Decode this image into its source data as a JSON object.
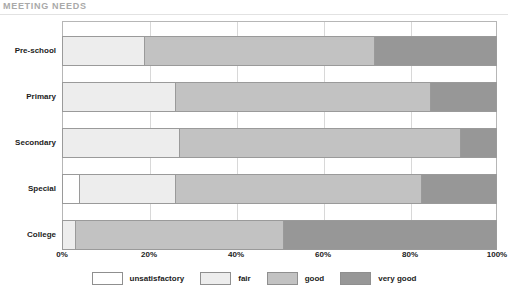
{
  "chart_data": {
    "type": "bar",
    "orientation": "horizontal",
    "stacked": true,
    "stack_mode": "percent",
    "title": "MEETING NEEDS",
    "xlabel": "",
    "ylabel": "",
    "xlim": [
      0,
      100
    ],
    "xticks": [
      0,
      20,
      40,
      60,
      80,
      100
    ],
    "xticklabels": [
      "0%",
      "20%",
      "40%",
      "60%",
      "80%",
      "100%"
    ],
    "grid": true,
    "legend_position": "bottom",
    "categories": [
      "Pre-school",
      "Primary",
      "Secondary",
      "Special",
      "College"
    ],
    "series": [
      {
        "name": "unsatisfactory",
        "color": "#ffffff",
        "values": [
          0,
          0,
          0,
          4,
          0
        ]
      },
      {
        "name": "fair",
        "color": "#ededed",
        "values": [
          19,
          26,
          27,
          22,
          3
        ]
      },
      {
        "name": "good",
        "color": "#c2c2c2",
        "values": [
          53,
          59,
          65,
          57,
          48
        ]
      },
      {
        "name": "very good",
        "color": "#979797",
        "values": [
          28,
          15,
          8,
          17,
          49
        ]
      }
    ]
  },
  "title": "MEETING NEEDS",
  "axis": {
    "ticks": [
      {
        "label": "0%",
        "value": 0
      },
      {
        "label": "20%",
        "value": 20
      },
      {
        "label": "40%",
        "value": 40
      },
      {
        "label": "60%",
        "value": 60
      },
      {
        "label": "80%",
        "value": 80
      },
      {
        "label": "100%",
        "value": 100
      }
    ]
  },
  "categories": [
    {
      "label": "Pre-school"
    },
    {
      "label": "Primary"
    },
    {
      "label": "Secondary"
    },
    {
      "label": "Special"
    },
    {
      "label": "College"
    }
  ],
  "legend": [
    {
      "label": "unsatisfactory",
      "color": "#ffffff"
    },
    {
      "label": "fair",
      "color": "#ededed"
    },
    {
      "label": "good",
      "color": "#c2c2c2"
    },
    {
      "label": "very good",
      "color": "#979797"
    }
  ]
}
